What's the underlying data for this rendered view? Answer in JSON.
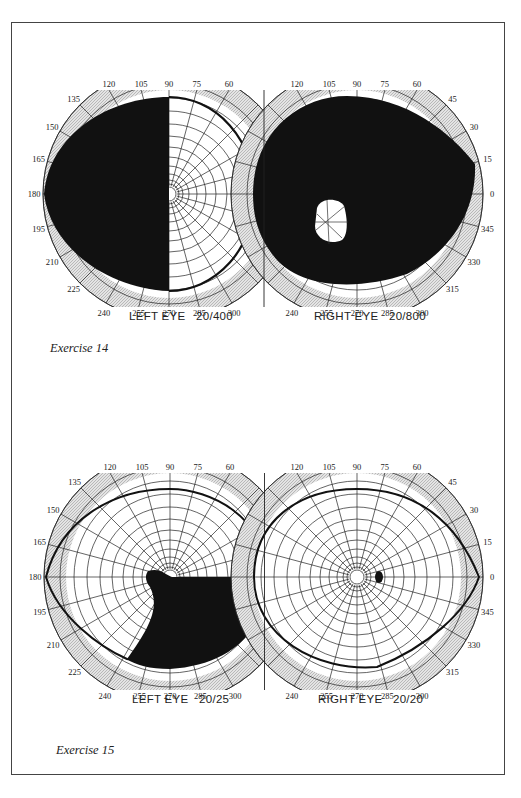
{
  "figure": {
    "exercises": [
      {
        "caption": "Exercise 14",
        "left_eye": {
          "label": "LEFT EYE",
          "acuity": "20/400",
          "center": [
            169,
            194
          ],
          "field": "left-half-black"
        },
        "right_eye": {
          "label": "RIGHT EYE",
          "acuity": "20/800",
          "center": [
            357,
            194
          ],
          "field": "mostly-black-with-island"
        }
      },
      {
        "caption": "Exercise 15",
        "left_eye": {
          "label": "LEFT EYE",
          "acuity": "20/25",
          "center": [
            170,
            577
          ],
          "field": "inferior-nasal-defect"
        },
        "right_eye": {
          "label": "RIGHT EYE",
          "acuity": "20/20",
          "center": [
            357,
            577
          ],
          "field": "normal-with-blind-spot"
        }
      }
    ],
    "degree_labels": {
      "top": [
        "120",
        "105",
        "90",
        "75",
        "60"
      ],
      "bottom": [
        "240",
        "255",
        "270",
        "285",
        "300"
      ],
      "left_side": [
        "135",
        "150",
        "165",
        "180",
        "195",
        "210",
        "225"
      ],
      "right_side": [
        "45",
        "30",
        "15",
        "0",
        "345",
        "330",
        "315"
      ]
    },
    "colors": {
      "ink": "#111111",
      "plate_shade": "#d9d9d9",
      "field_white": "#ffffff",
      "grid": "#222222"
    }
  },
  "text": {
    "ex14_left_label": "LEFT EYE   20/400",
    "ex14_right_label": "RIGHT EYE   20/800",
    "ex14_caption": "Exercise 14",
    "ex15_left_label": "LEFT EYE   20/25",
    "ex15_right_label": "RIGHT EYE   20/20",
    "ex15_caption": "Exercise 15"
  }
}
